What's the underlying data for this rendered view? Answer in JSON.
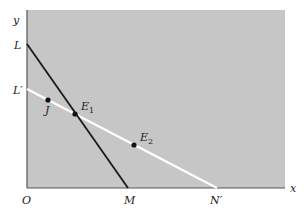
{
  "diagram": {
    "axes": {
      "x_label": "x",
      "y_label": "y",
      "origin_label": "O"
    },
    "region": {
      "fill": "#c6c6c6"
    },
    "lines": [
      {
        "name": "LM",
        "color": "#1a1a1a",
        "start_label": "L",
        "end_label": "M"
      },
      {
        "name": "L'N'",
        "color": "#ffffff",
        "start_label": "L′",
        "end_label": "N′"
      }
    ],
    "points": [
      {
        "label": "J",
        "sub": ""
      },
      {
        "label": "E",
        "sub": "1"
      },
      {
        "label": "E",
        "sub": "2"
      }
    ]
  }
}
